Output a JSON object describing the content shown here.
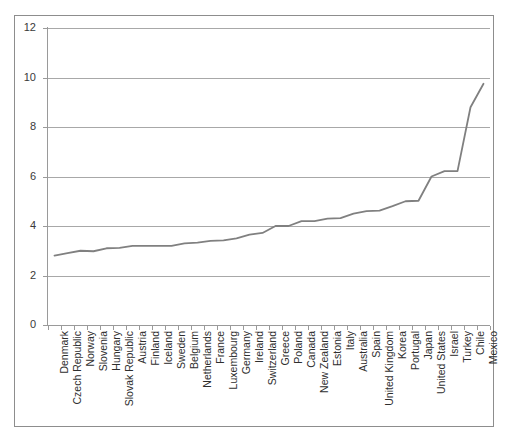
{
  "chart_data": {
    "type": "line",
    "title": "",
    "subtitle": "",
    "xlabel": "",
    "ylabel": "",
    "ylim": [
      0,
      12
    ],
    "ytick_labels": [
      "12",
      "10",
      "8",
      "6",
      "4",
      "2",
      "0"
    ],
    "ytick_values": [
      12,
      10,
      8,
      6,
      4,
      2,
      0
    ],
    "grid": true,
    "legend": false,
    "legend_position": "none",
    "line_color": "#808080",
    "categories": [
      "Denmark",
      "Czech Republic",
      "Norway",
      "Slovenia",
      "Hungary",
      "Slovak Republic",
      "Austria",
      "Finland",
      "Iceland",
      "Sweden",
      "Belgium",
      "Netherlands",
      "France",
      "Luxembourg",
      "Germany",
      "Ireland",
      "Switzerland",
      "Greece",
      "Poland",
      "Canada",
      "New Zealand",
      "Estonia",
      "Italy",
      "Australia",
      "Spain",
      "United Kingdom",
      "Korea",
      "Portugal",
      "Japan",
      "United States",
      "Israel",
      "Turkey",
      "Chile",
      "Mexico"
    ],
    "values": [
      2.8,
      2.9,
      3.0,
      2.98,
      3.1,
      3.12,
      3.2,
      3.2,
      3.2,
      3.2,
      3.3,
      3.33,
      3.4,
      3.42,
      3.5,
      3.65,
      3.72,
      4.0,
      4.0,
      4.2,
      4.2,
      4.3,
      4.32,
      4.5,
      4.6,
      4.62,
      4.8,
      5.0,
      5.02,
      6.0,
      6.22,
      6.22,
      8.8,
      9.75
    ]
  }
}
